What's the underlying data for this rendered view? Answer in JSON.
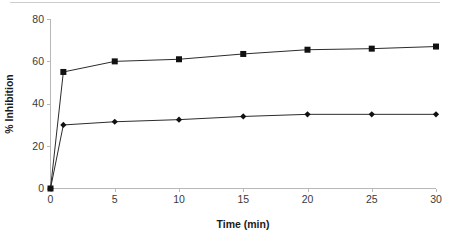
{
  "chart_data": {
    "type": "line",
    "title": "",
    "xlabel": "Time (min)",
    "ylabel": "% Inhibition",
    "xlim": [
      0,
      30
    ],
    "ylim": [
      0,
      80
    ],
    "xticks": [
      0,
      5,
      10,
      15,
      20,
      25,
      30
    ],
    "yticks": [
      0,
      20,
      40,
      60,
      80
    ],
    "xticklabels": [
      "0",
      "5",
      "10",
      "15",
      "20",
      "25",
      "30"
    ],
    "yticklabels": [
      "0",
      "20",
      "40",
      "60",
      "80"
    ],
    "grid": false,
    "legend": null,
    "legend_position": "none",
    "x": [
      0,
      1,
      5,
      10,
      15,
      20,
      25,
      30
    ],
    "series": [
      {
        "name": "series-squares",
        "marker": "square",
        "color": "#111111",
        "values": [
          0,
          55,
          60,
          61,
          63.5,
          65.5,
          66,
          67
        ]
      },
      {
        "name": "series-diamonds",
        "marker": "diamond",
        "color": "#111111",
        "values": [
          0,
          30,
          31.5,
          32.5,
          34,
          35,
          35,
          35
        ]
      }
    ]
  },
  "axes": {
    "x_title": "Time (min)",
    "y_title": "% Inhibition"
  },
  "colors": {
    "line": "#2b2b2b",
    "marker": "#111111",
    "axis": "#b8b8b8",
    "text": "#3a3a3a",
    "top_rule": "#cdcdcd",
    "background": "#ffffff"
  }
}
